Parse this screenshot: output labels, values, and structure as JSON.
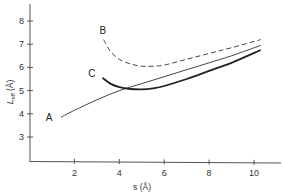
{
  "chart_data": {
    "type": "line",
    "title": "",
    "xlabel": "s (Å)",
    "ylabel": "L_eff (Å)",
    "ylabel_main": "L",
    "ylabel_sub": "eff",
    "ylabel_unit": "(Å)",
    "xlim": [
      0,
      11.5
    ],
    "ylim": [
      2,
      9
    ],
    "xticks": [
      2,
      4,
      6,
      8,
      10
    ],
    "yticks": [
      3,
      4,
      5,
      6,
      7,
      8
    ],
    "grid": false,
    "legend": "none (curves labeled inline)",
    "series": [
      {
        "name": "A",
        "style": "solid-thin",
        "x": [
          1.4,
          2.0,
          3.0,
          4.0,
          5.0,
          6.0,
          7.0,
          8.0,
          9.0,
          10.3
        ],
        "y": [
          3.85,
          4.15,
          4.6,
          5.0,
          5.3,
          5.6,
          5.9,
          6.2,
          6.5,
          6.95
        ]
      },
      {
        "name": "B",
        "style": "dashed",
        "x": [
          3.3,
          3.6,
          4.0,
          4.5,
          5.0,
          5.5,
          6.0,
          7.0,
          8.0,
          9.0,
          10.3
        ],
        "y": [
          7.2,
          6.7,
          6.35,
          6.15,
          6.05,
          6.05,
          6.1,
          6.35,
          6.6,
          6.85,
          7.2
        ]
      },
      {
        "name": "C",
        "style": "solid-thick",
        "x": [
          3.25,
          3.6,
          4.0,
          4.5,
          5.0,
          5.5,
          6.0,
          7.0,
          8.0,
          9.0,
          10.3
        ],
        "y": [
          5.55,
          5.3,
          5.15,
          5.07,
          5.05,
          5.1,
          5.2,
          5.5,
          5.85,
          6.2,
          6.75
        ]
      }
    ],
    "annotations": [
      {
        "text": "A",
        "x": 0.9,
        "y": 3.85
      },
      {
        "text": "B",
        "x": 3.3,
        "y": 7.6
      },
      {
        "text": "C",
        "x": 2.8,
        "y": 5.75
      }
    ]
  },
  "axes": {
    "x_tick_labels": [
      "2",
      "4",
      "6",
      "8",
      "10"
    ],
    "y_tick_labels": [
      "3",
      "4",
      "5",
      "6",
      "7",
      "8"
    ],
    "x_label": "s (Å)"
  },
  "labels": {
    "curve_a": "A",
    "curve_b": "B",
    "curve_c": "C"
  }
}
